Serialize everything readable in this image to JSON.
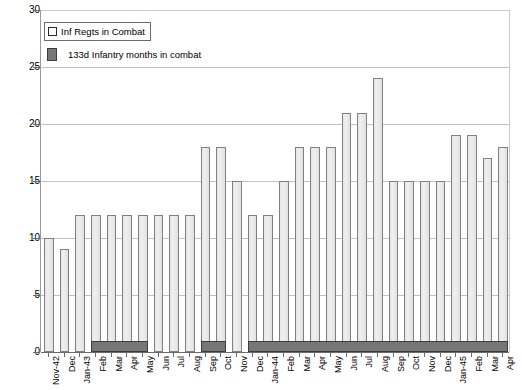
{
  "chart_data": {
    "type": "bar",
    "title": "",
    "xlabel": "",
    "ylabel": "",
    "ylim": [
      0,
      30
    ],
    "ytick_step": 5,
    "yticks": [
      "0",
      "5",
      "10",
      "15",
      "20",
      "25",
      "30"
    ],
    "grid": true,
    "legend_position": "top-left",
    "bar_style": "overlay",
    "categories": [
      "Nov-42",
      "Dec",
      "Jan-43",
      "Feb",
      "Mar",
      "Apr",
      "May",
      "Jun",
      "Jul",
      "Aug",
      "Sep",
      "Oct",
      "Nov",
      "Dec",
      "Jan-44",
      "Feb",
      "Mar",
      "Apr",
      "May",
      "Jun",
      "Jul",
      "Aug",
      "Sep",
      "Oct",
      "Nov",
      "Dec",
      "Jan-45",
      "Feb",
      "Mar",
      "Apr"
    ],
    "series": [
      {
        "name": "Inf Regts in Combat",
        "color": "#e9e9e9",
        "edge_color": "#808080",
        "values": [
          10,
          9,
          12,
          12,
          12,
          12,
          12,
          12,
          12,
          12,
          18,
          18,
          15,
          12,
          12,
          15,
          18,
          18,
          18,
          21,
          21,
          24,
          15,
          15,
          15,
          15,
          19,
          19,
          17,
          18
        ]
      },
      {
        "name": "133d Infantry months in combat",
        "color": "#767676",
        "edge_color": "#3d3d3d",
        "values": [
          0,
          0,
          0,
          1,
          1,
          1,
          1,
          0,
          0,
          0,
          1,
          1,
          0,
          1,
          1,
          1,
          1,
          1,
          1,
          1,
          1,
          1,
          1,
          1,
          1,
          1,
          1,
          1,
          1,
          1
        ]
      }
    ]
  },
  "legend": {
    "items": [
      {
        "label": "Inf Regts in Combat",
        "swatch": "open-square-icon"
      },
      {
        "label": "133d Infantry months in combat",
        "swatch": "filled-square-icon"
      }
    ]
  }
}
